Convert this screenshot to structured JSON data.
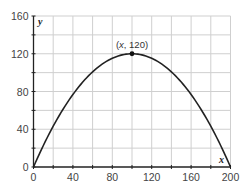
{
  "chart_data": {
    "type": "line",
    "title": "",
    "xlabel": "x",
    "ylabel": "y",
    "xlim": [
      0,
      200
    ],
    "ylim": [
      0,
      160
    ],
    "grid": true,
    "grid_step": {
      "x": 20,
      "y": 20
    },
    "x_ticks": [
      0,
      40,
      80,
      120,
      160,
      200
    ],
    "y_ticks": [
      0,
      40,
      80,
      120,
      160
    ],
    "x_tick_labels": [
      "0",
      "40",
      "80",
      "120",
      "160",
      "200"
    ],
    "y_tick_labels": [
      "0",
      "40",
      "80",
      "120",
      "160"
    ],
    "series": [
      {
        "name": "parabola",
        "equation": "y = 120 - 0.012(x - 100)^2",
        "x": [
          0,
          20,
          40,
          60,
          80,
          100,
          120,
          140,
          160,
          180,
          200
        ],
        "values": [
          0,
          43.2,
          76.8,
          100.8,
          115.2,
          120,
          115.2,
          100.8,
          76.8,
          43.2,
          0
        ],
        "color": "#222222"
      }
    ],
    "annotations": [
      {
        "type": "point",
        "x": 100,
        "y": 120,
        "label_prefix": "(",
        "label_var": "x",
        "label_suffix": ", 120)"
      }
    ],
    "legend": null
  },
  "labels": {
    "x_axis": "x",
    "y_axis": "y",
    "vertex_open": "(",
    "vertex_var": "x",
    "vertex_rest": ", 120)"
  },
  "colors": {
    "grid": "#cfcfcf",
    "axis": "#222222",
    "curve": "#222222",
    "text": "#444444"
  }
}
